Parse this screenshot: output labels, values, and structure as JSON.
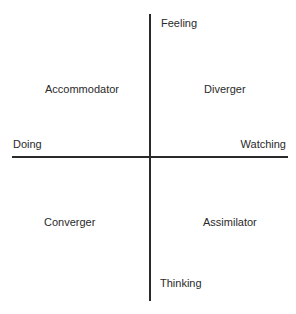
{
  "diagram": {
    "type": "quadrant",
    "axes": {
      "vertical": {
        "top": "Feeling",
        "bottom": "Thinking"
      },
      "horizontal": {
        "left": "Doing",
        "right": "Watching"
      }
    },
    "quadrants": {
      "top_left": "Accommodator",
      "top_right": "Diverger",
      "bottom_left": "Converger",
      "bottom_right": "Assimilator"
    },
    "line_color": "#2a2a2a"
  }
}
